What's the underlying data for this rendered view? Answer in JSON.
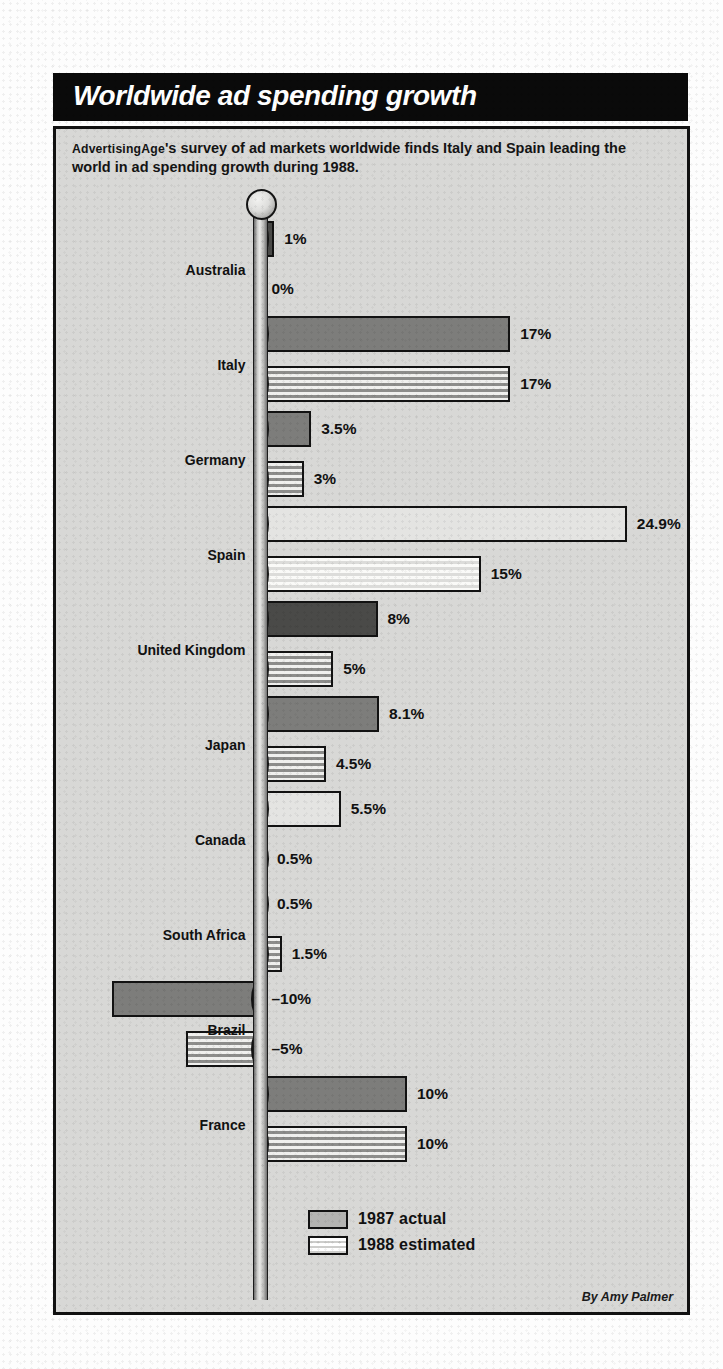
{
  "header": {
    "title": "Worldwide ad spending growth"
  },
  "deck": {
    "smallcaps_1": "Advertising",
    "smallcaps_2": "Age",
    "text": "'s survey of ad markets worldwide finds Italy and Spain leading the world in ad spending growth during 1988."
  },
  "legend": {
    "items": [
      {
        "label": "1987 actual",
        "key": "y87"
      },
      {
        "label": "1988 estimated",
        "key": "y88"
      }
    ]
  },
  "credit": "By Amy Palmer",
  "colors": {
    "title_bar": "#0a0a0a",
    "panel": "#d8d8d6",
    "ink": "#121212",
    "bar_1987": "#7d7d7b",
    "bar_1988": "#9a9a98"
  },
  "chart_data": {
    "type": "bar",
    "orientation": "horizontal",
    "title": "Worldwide ad spending growth",
    "subtitle": "Advertising Age's survey of ad markets worldwide finds Italy and Spain leading the world in ad spending growth during 1988.",
    "xlabel": "",
    "ylabel": "",
    "unit": "%",
    "grid": false,
    "legend_position": "bottom",
    "xlim": [
      -10,
      24.9
    ],
    "zero_axis": true,
    "categories": [
      "Australia",
      "Italy",
      "Germany",
      "Spain",
      "United Kingdom",
      "Japan",
      "Canada",
      "South Africa",
      "Brazil",
      "France"
    ],
    "series": [
      {
        "name": "1987 actual",
        "values": [
          1,
          17,
          3.5,
          24.9,
          8,
          8.1,
          5.5,
          0.5,
          -10,
          10
        ],
        "labels": [
          "1%",
          "17%",
          "3.5%",
          "24.9%",
          "8%",
          "8.1%",
          "5.5%",
          "0.5%",
          "–10%",
          "10%"
        ]
      },
      {
        "name": "1988 estimated",
        "values": [
          0,
          17,
          3,
          15,
          5,
          4.5,
          0.5,
          1.5,
          -5,
          10
        ],
        "labels": [
          "0%",
          "17%",
          "3%",
          "15%",
          "5%",
          "4.5%",
          "0.5%",
          "1.5%",
          "–5%",
          "10%"
        ]
      }
    ]
  }
}
